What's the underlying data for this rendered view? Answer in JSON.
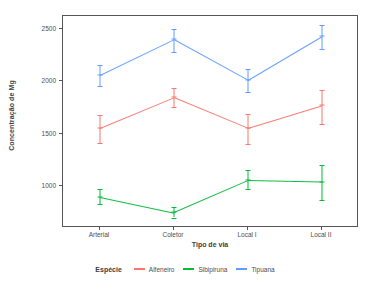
{
  "chart_data": {
    "type": "line",
    "title": "",
    "subtitle": "",
    "xlabel": "Tipo de via",
    "ylabel": "Concentração de Mg",
    "categories": [
      "Arterial",
      "Coletor",
      "Local I",
      "Local II"
    ],
    "yticks": [
      1000,
      1500,
      2000,
      2500
    ],
    "ylim": [
      600,
      2620
    ],
    "grid": false,
    "legend_position": "bottom",
    "legend_title": "Espécie",
    "error_bars": "vertical",
    "series": [
      {
        "name": "Alfeneiro",
        "color": "#F8766D",
        "values": [
          1553,
          1845,
          1553,
          1768
        ],
        "lower": [
          1408,
          1750,
          1405,
          1590
        ],
        "upper": [
          1680,
          1935,
          1690,
          1915
        ]
      },
      {
        "name": "Sibipiruna",
        "color": "#00BA38",
        "values": [
          900,
          750,
          1055,
          1040
        ],
        "lower": [
          828,
          700,
          968,
          868
        ],
        "upper": [
          975,
          800,
          1150,
          1205
        ]
      },
      {
        "name": "Tipuana",
        "color": "#619CFF",
        "values": [
          2060,
          2400,
          2013,
          2430
        ],
        "lower": [
          1955,
          2278,
          1893,
          2305
        ],
        "upper": [
          2155,
          2500,
          2113,
          2538
        ]
      }
    ]
  },
  "axis": {
    "y_title": "Concentração de Mg",
    "x_title": "Tipo de via",
    "y_tick_labels": [
      "2500",
      "2000",
      "1500",
      "1000"
    ],
    "x_tick_labels": [
      "Arterial",
      "Coletor",
      "Local I",
      "Local II"
    ]
  },
  "legend": {
    "title": "Espécie",
    "items": [
      {
        "label": "Alfeneiro",
        "color": "#F8766D"
      },
      {
        "label": "Sibipiruna",
        "color": "#00BA38"
      },
      {
        "label": "Tipuana",
        "color": "#619CFF"
      }
    ]
  }
}
